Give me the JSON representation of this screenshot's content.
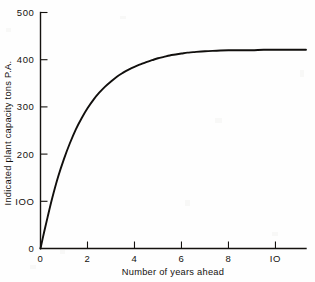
{
  "chart_data": {
    "type": "line",
    "title": "",
    "xlabel": "Number of years ahead",
    "ylabel": "Indicated plant capacity tons P.A.",
    "xlim": [
      0,
      11.3
    ],
    "ylim": [
      0,
      500
    ],
    "grid": false,
    "legend": null,
    "x_ticks": [
      0,
      2,
      4,
      6,
      8,
      10
    ],
    "x_tick_labels": [
      "0",
      "2",
      "4",
      "6",
      "8",
      "IO"
    ],
    "y_ticks": [
      0,
      100,
      200,
      300,
      400,
      500
    ],
    "y_tick_labels": [
      "0",
      "IOO",
      "200",
      "300",
      "400",
      "500"
    ],
    "asymptote": 420,
    "series": [
      {
        "name": "Indicated plant capacity",
        "color": "#110f0d",
        "x": [
          0,
          0.15,
          0.3,
          0.5,
          0.75,
          1,
          1.25,
          1.5,
          1.75,
          2,
          2.25,
          2.5,
          2.75,
          3,
          3.25,
          3.5,
          3.75,
          4,
          4.25,
          4.5,
          4.75,
          5,
          5.25,
          5.5,
          5.75,
          6,
          6.25,
          6.5,
          7,
          7.5,
          8,
          8.5,
          9,
          9.5,
          10,
          10.5,
          11,
          11.3
        ],
        "y": [
          0,
          34,
          66,
          107,
          152,
          190,
          223,
          252,
          276,
          297,
          315,
          330,
          343,
          354,
          364,
          372,
          379,
          385,
          390,
          395,
          399,
          403,
          406,
          409,
          411,
          413,
          415,
          416,
          418,
          419,
          420,
          420,
          420,
          421,
          421,
          421,
          421,
          421
        ]
      }
    ]
  },
  "figure": {
    "background_color": "#fefefe",
    "ink_color": "#15120f"
  }
}
